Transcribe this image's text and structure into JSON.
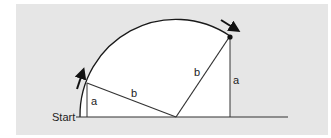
{
  "diagram": {
    "start_label": "Start",
    "labels": {
      "left_height": "a",
      "left_hyp": "b",
      "right_hyp": "b",
      "right_height": "a"
    },
    "colors": {
      "panel": "#e6e6e6",
      "inner": "#ffffff",
      "stroke": "#1a1a1a"
    }
  }
}
